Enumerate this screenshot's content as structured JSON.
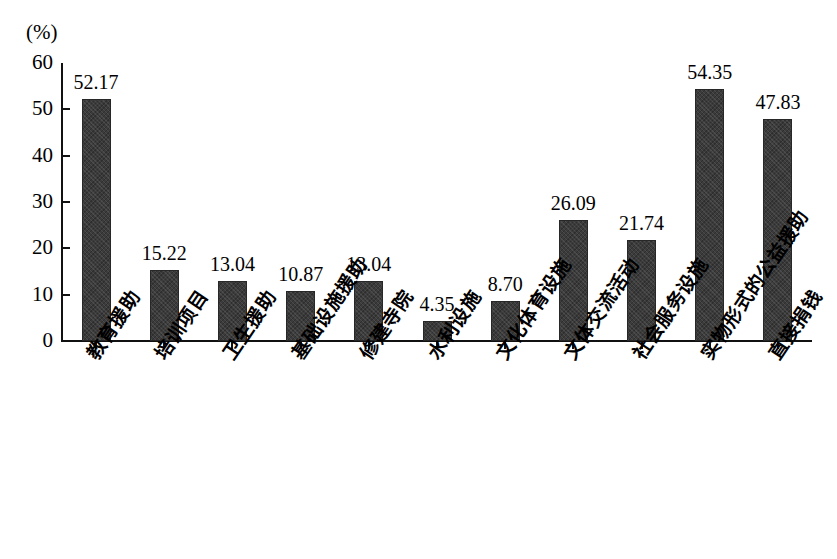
{
  "chart_data": {
    "type": "bar",
    "title": "",
    "subtitle": "",
    "xlabel": "",
    "ylabel": "(%)",
    "ylim": [
      0,
      60
    ],
    "ytick_values": [
      0,
      10,
      20,
      30,
      40,
      50,
      60
    ],
    "ytick_labels": [
      "0",
      "10",
      "20",
      "30",
      "40",
      "50",
      "60"
    ],
    "grid": false,
    "legend": null,
    "legend_position": "none",
    "bar_color": "#3b3b3b",
    "axis_color": "#111111",
    "categories": [
      "教育援助",
      "培训项目",
      "卫生援助",
      "基础设施援助",
      "修建寺院",
      "水利设施",
      "文化体育设施",
      "文体交流活动",
      "社会服务设施",
      "实物形式的公益援助",
      "直接捐钱"
    ],
    "values": [
      52.17,
      15.22,
      13.04,
      10.87,
      13.04,
      4.35,
      8.7,
      26.09,
      21.74,
      54.35,
      47.83
    ],
    "value_labels": [
      "52.17",
      "15.22",
      "13.04",
      "10.87",
      "13.04",
      "4.35",
      "8.70",
      "26.09",
      "21.74",
      "54.35",
      "47.83"
    ]
  }
}
